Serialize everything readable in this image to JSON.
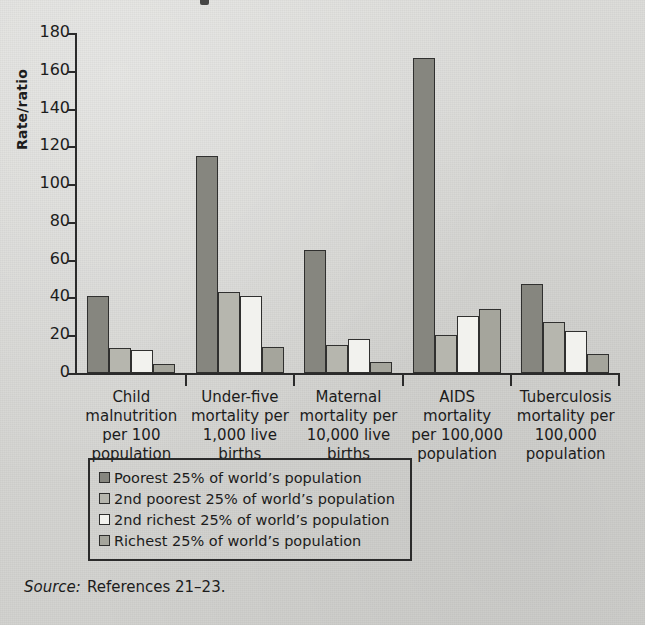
{
  "chart_data": {
    "type": "bar",
    "title": "",
    "xlabel": "",
    "ylabel": "Rate/ratio",
    "ylim": [
      0,
      180
    ],
    "ytick_step": 20,
    "yticks": [
      0,
      20,
      40,
      60,
      80,
      100,
      120,
      140,
      160,
      180
    ],
    "grid": false,
    "legend_position": "below-plot",
    "categories": [
      "Child\nmalnutrition\nper 100\npopulation",
      "Under-five\nmortality per\n1,000 live\nbirths",
      "Maternal\nmortality per\n10,000 live\nbirths",
      "AIDS\nmortality\nper 100,000\npopulation",
      "Tuberculosis\nmortality per\n100,000\npopulation"
    ],
    "series": [
      {
        "name": "Poorest 25% of world’s population",
        "color": "#86867f",
        "values": [
          41,
          115,
          65,
          167,
          47
        ]
      },
      {
        "name": "2nd poorest 25% of world’s population",
        "color": "#b6b6ae",
        "values": [
          13,
          43,
          15,
          20,
          27
        ]
      },
      {
        "name": "2nd richest 25% of world’s population",
        "color": "#f2f2ee",
        "values": [
          12,
          41,
          18,
          30,
          22
        ]
      },
      {
        "name": "Richest 25% of world’s population",
        "color": "#a5a59c",
        "values": [
          5,
          14,
          6,
          34,
          10
        ]
      }
    ]
  },
  "legend": {
    "items": [
      "Poorest 25% of world’s population",
      "2nd poorest 25% of world’s population",
      "2nd richest 25% of world’s population",
      "Richest 25% of world’s population"
    ]
  },
  "source": {
    "label": "Source:",
    "text": "References 21–23."
  }
}
